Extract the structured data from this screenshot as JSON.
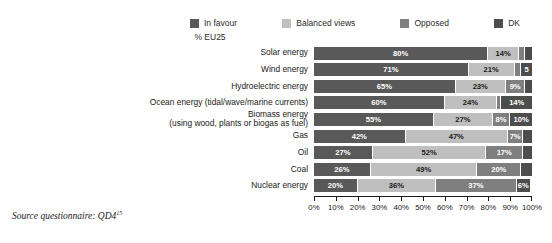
{
  "legend": {
    "items": [
      {
        "label": "In favour",
        "color": "#595959"
      },
      {
        "label": "Balanced views",
        "color": "#bfbfbf"
      },
      {
        "label": "Opposed",
        "color": "#7f7f7f"
      },
      {
        "label": "DK",
        "color": "#4d4d4d"
      }
    ]
  },
  "subtitle": "% EU25",
  "source_note": {
    "text": "Source questionnaire: QD4",
    "footnote_marker": "15"
  },
  "axis": {
    "tick_labels": [
      "0%",
      "10%",
      "20%",
      "30%",
      "40%",
      "50%",
      "60%",
      "70%",
      "80%",
      "90%",
      "100%"
    ]
  },
  "chart_data": {
    "type": "bar",
    "orientation": "horizontal",
    "stacked": true,
    "title": "",
    "subtitle": "% EU25",
    "xlabel": "",
    "ylabel": "",
    "xlim": [
      0,
      100
    ],
    "grid": false,
    "legend_position": "top",
    "categories": [
      "Solar energy",
      "Wind energy",
      "Hydroelectric energy",
      "Ocean energy (tidal/wave/marine currents)",
      "Biomass energy\n(using wood, plants or biogas as fuel)",
      "Gas",
      "Oil",
      "Coal",
      "Nuclear energy"
    ],
    "series": [
      {
        "name": "In favour",
        "color": "#595959",
        "values": [
          80,
          71,
          65,
          60,
          55,
          42,
          27,
          26,
          20
        ]
      },
      {
        "name": "Balanced views",
        "color": "#bfbfbf",
        "values": [
          14,
          21,
          23,
          24,
          27,
          47,
          52,
          49,
          36
        ]
      },
      {
        "name": "Opposed",
        "color": "#7f7f7f",
        "values": [
          3,
          3,
          9,
          2,
          8,
          7,
          17,
          20,
          37
        ]
      },
      {
        "name": "DK",
        "color": "#4d4d4d",
        "values": [
          3,
          5,
          3,
          14,
          10,
          4,
          4,
          5,
          6
        ]
      }
    ],
    "value_labels": [
      [
        "80%",
        "14%",
        "",
        ""
      ],
      [
        "71%",
        "21%",
        "",
        "5"
      ],
      [
        "65%",
        "23%",
        "9%",
        ""
      ],
      [
        "60%",
        "24%",
        "",
        "14%"
      ],
      [
        "55%",
        "27%",
        "8%",
        "10%"
      ],
      [
        "42%",
        "47%",
        "7%",
        ""
      ],
      [
        "27%",
        "52%",
        "17%",
        ""
      ],
      [
        "26%",
        "49%",
        "20%",
        ""
      ],
      [
        "20%",
        "36%",
        "37%",
        "6%"
      ]
    ]
  }
}
